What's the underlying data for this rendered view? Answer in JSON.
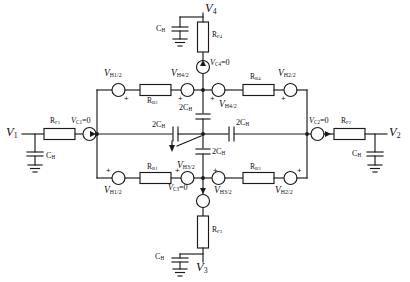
{
  "figure": {
    "type": "electrical-circuit-schematic",
    "line_color": "#1a1a1a"
  },
  "ports": [
    {
      "id": "v1",
      "label": "V",
      "sub": "1",
      "position": "left"
    },
    {
      "id": "v2",
      "label": "V",
      "sub": "2",
      "position": "right"
    },
    {
      "id": "v3",
      "label": "V",
      "sub": "3",
      "position": "bottom"
    },
    {
      "id": "v4",
      "label": "V",
      "sub": "4",
      "position": "top"
    }
  ],
  "resistors": {
    "rf1": {
      "label": "R",
      "sub": "F1"
    },
    "rf2": {
      "label": "R",
      "sub": "F2"
    },
    "rf3": {
      "label": "R",
      "sub": "F3"
    },
    "rf4": {
      "label": "R",
      "sub": "F4"
    },
    "rb1": {
      "label": "R",
      "sub": "B1"
    },
    "rb2": {
      "label": "R",
      "sub": "B2"
    },
    "rb3": {
      "label": "R",
      "sub": "B3"
    },
    "rb4": {
      "label": "R",
      "sub": "B4"
    }
  },
  "capacitors": {
    "ch_v1": {
      "label": "C",
      "sub": "H"
    },
    "ch_v2": {
      "label": "C",
      "sub": "H"
    },
    "ch_v3": {
      "label": "C",
      "sub": "H"
    },
    "ch_v4": {
      "label": "C",
      "sub": "H"
    },
    "twoch_top": {
      "label": "2C",
      "sub": "H"
    },
    "twoch_bottom": {
      "label": "2C",
      "sub": "H"
    },
    "twoch_left": {
      "label": "2C",
      "sub": "H"
    },
    "twoch_right": {
      "label": "2C",
      "sub": "H"
    }
  },
  "sources": {
    "vc1": {
      "label": "V",
      "sub": "C1",
      "value": "=0"
    },
    "vc2": {
      "label": "V",
      "sub": "C2",
      "value": "=0"
    },
    "vc3": {
      "label": "V",
      "sub": "C3",
      "value": "=0"
    },
    "vc4": {
      "label": "V",
      "sub": "C4",
      "value": "=0"
    },
    "vh1_top": {
      "label": "V",
      "sub": "H1/2"
    },
    "vh1_bottom": {
      "label": "V",
      "sub": "H1/2"
    },
    "vh2_top": {
      "label": "V",
      "sub": "H2/2"
    },
    "vh2_bottom": {
      "label": "V",
      "sub": "H2/2"
    },
    "vh3_left": {
      "label": "V",
      "sub": "H3/2"
    },
    "vh3_right": {
      "label": "V",
      "sub": "H3/2"
    },
    "vh4_left": {
      "label": "V",
      "sub": "H4/2"
    },
    "vh4_right": {
      "label": "V",
      "sub": "H4/2"
    }
  },
  "polarity": {
    "plus": "+"
  }
}
